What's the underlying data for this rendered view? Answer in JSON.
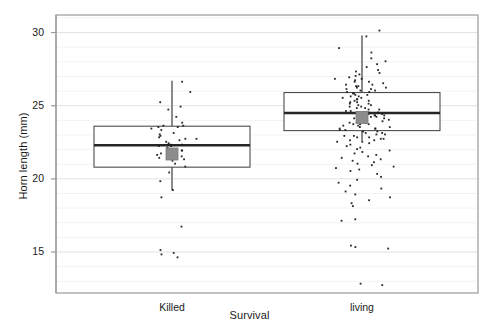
{
  "chart_data": {
    "type": "box",
    "title": "",
    "xlabel": "Survival",
    "ylabel": "Horn length (mm)",
    "categories": [
      "Killed",
      "living"
    ],
    "yticks": [
      15,
      20,
      25,
      30
    ],
    "ylim": [
      12.2,
      31.2
    ],
    "grid": "horizontal-minor-faint",
    "legend": "none",
    "axis_color": "#9a9a9a",
    "box_line_color": "#4d4d4d",
    "median_line_color": "#262626",
    "mean_marker_color": "#8c8c8c",
    "point_color": "#1a1a1a",
    "series": [
      {
        "name": "Killed",
        "n": 46,
        "box": {
          "whisker_low": 19.2,
          "q1": 20.8,
          "median": 22.3,
          "q3": 23.6,
          "whisker_high": 26.7,
          "mean": 21.7
        },
        "points": [
          26.7,
          26.0,
          25.3,
          25.0,
          24.8,
          24.3,
          23.9,
          23.7,
          23.7,
          23.6,
          23.6,
          23.5,
          23.4,
          23.2,
          23.1,
          23.0,
          22.9,
          22.8,
          22.8,
          22.7,
          22.6,
          22.5,
          22.4,
          22.4,
          22.3,
          22.3,
          22.2,
          22.1,
          22.0,
          22.0,
          21.9,
          21.8,
          21.7,
          21.6,
          21.5,
          21.4,
          21.3,
          21.1,
          20.9,
          20.5,
          19.9,
          19.3,
          18.8,
          16.8,
          15.2,
          15.0,
          14.9,
          14.7
        ]
      },
      {
        "name": "living",
        "n": 150,
        "box": {
          "whisker_low": 22.6,
          "q1": 23.3,
          "median": 24.5,
          "q3": 25.9,
          "whisker_high": 29.8,
          "mean": 24.2
        },
        "points": [
          30.2,
          29.8,
          29.0,
          28.7,
          28.3,
          28.1,
          27.9,
          27.7,
          27.5,
          27.4,
          27.3,
          27.2,
          27.1,
          27.0,
          26.9,
          26.9,
          26.8,
          26.7,
          26.7,
          26.6,
          26.5,
          26.5,
          26.4,
          26.4,
          26.3,
          26.3,
          26.2,
          26.2,
          26.1,
          26.1,
          26.0,
          26.0,
          25.9,
          25.9,
          25.8,
          25.8,
          25.7,
          25.7,
          25.6,
          25.6,
          25.5,
          25.5,
          25.4,
          25.4,
          25.3,
          25.3,
          25.2,
          25.2,
          25.1,
          25.1,
          25.0,
          25.0,
          24.9,
          24.9,
          24.8,
          24.8,
          24.7,
          24.7,
          24.6,
          24.6,
          24.5,
          24.5,
          24.5,
          24.4,
          24.4,
          24.4,
          24.3,
          24.3,
          24.2,
          24.2,
          24.2,
          24.1,
          24.1,
          24.0,
          24.0,
          24.0,
          23.9,
          23.9,
          23.8,
          23.8,
          23.8,
          23.7,
          23.7,
          23.6,
          23.6,
          23.5,
          23.5,
          23.5,
          23.4,
          23.4,
          23.3,
          23.3,
          23.2,
          23.2,
          23.1,
          23.1,
          23.0,
          23.0,
          22.9,
          22.9,
          22.8,
          22.8,
          22.7,
          22.7,
          22.6,
          22.6,
          22.5,
          22.4,
          22.3,
          22.2,
          22.1,
          22.0,
          21.9,
          21.8,
          21.7,
          21.6,
          21.5,
          21.4,
          21.3,
          21.2,
          21.1,
          21.0,
          20.9,
          20.8,
          20.7,
          20.6,
          20.4,
          20.2,
          20.0,
          19.8,
          19.6,
          19.4,
          19.2,
          19.0,
          18.8,
          18.6,
          18.4,
          18.2,
          17.3,
          17.2,
          15.5,
          15.4,
          15.3,
          12.9,
          12.8
        ]
      }
    ]
  }
}
